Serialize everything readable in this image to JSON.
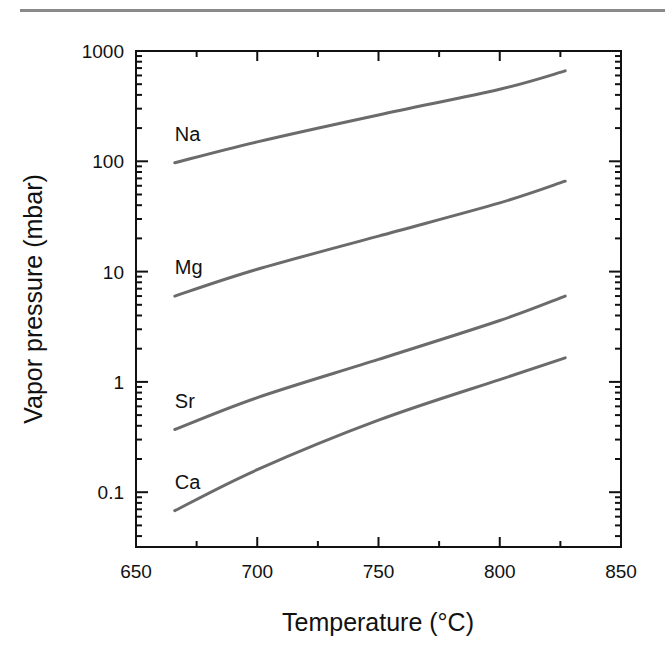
{
  "chart_data": {
    "type": "line",
    "title": "",
    "xlabel": "Temperature (°C)",
    "ylabel": "Vapor pressure (mbar)",
    "xlim": [
      650,
      850
    ],
    "ylim": [
      0.0316,
      1000
    ],
    "yscale": "log",
    "x_ticks": [
      650,
      700,
      750,
      800,
      850
    ],
    "x_tick_labels": [
      "650",
      "700",
      "750",
      "800",
      "850"
    ],
    "x_minor_ticks": [
      675,
      725,
      775,
      825
    ],
    "y_ticks": [
      0.1,
      1,
      10,
      100,
      1000
    ],
    "y_tick_labels": [
      "0.1",
      "1",
      "10",
      "100",
      "1000"
    ],
    "grid": false,
    "legend": "inline labels near left end of each curve",
    "line_color": "#6b6b6b",
    "series": [
      {
        "name": "Na",
        "x": [
          666,
          700,
          750,
          800,
          827
        ],
        "values": [
          97,
          150,
          263,
          450,
          660
        ]
      },
      {
        "name": "Mg",
        "x": [
          666,
          700,
          750,
          800,
          827
        ],
        "values": [
          6.0,
          10.5,
          21,
          42,
          66
        ]
      },
      {
        "name": "Sr",
        "x": [
          666,
          700,
          750,
          800,
          827
        ],
        "values": [
          0.37,
          0.72,
          1.6,
          3.6,
          6.0
        ]
      },
      {
        "name": "Ca",
        "x": [
          666,
          700,
          750,
          800,
          827
        ],
        "values": [
          0.068,
          0.16,
          0.45,
          1.05,
          1.65
        ]
      }
    ]
  }
}
